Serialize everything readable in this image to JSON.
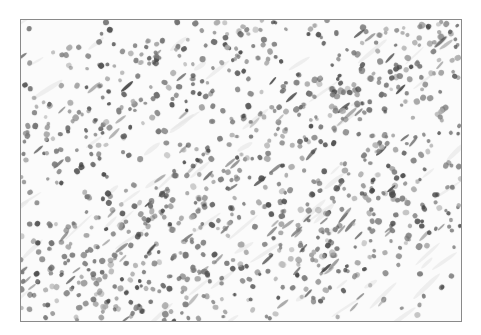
{
  "image": {
    "kind": "histology-micrograph",
    "description": "Grayscale light micrograph of densely packed round cell nuclei arranged in diagonal bands",
    "frame": {
      "x": 20,
      "y": 19,
      "width": 442,
      "height": 303,
      "border_color": "#8a8a8a"
    },
    "background_color": "#fbfbfb",
    "palette": {
      "nucleus_dark": "#4a4a4a",
      "nucleus_mid": "#7a7a7a",
      "nucleus_light": "#a8a8a8",
      "stroma": "#e6e6e6"
    },
    "bands": [
      {
        "x1": -40,
        "y1": 300,
        "x2": 480,
        "y2": -20,
        "width": 70,
        "density": 1.0
      },
      {
        "x1": -40,
        "y1": 160,
        "x2": 300,
        "y2": -40,
        "width": 60,
        "density": 0.9
      },
      {
        "x1": 100,
        "y1": 340,
        "x2": 480,
        "y2": 120,
        "width": 70,
        "density": 1.0
      },
      {
        "x1": -40,
        "y1": 360,
        "x2": 200,
        "y2": 230,
        "width": 40,
        "density": 0.6
      }
    ],
    "nucleus_count": 1100,
    "seed": 7
  }
}
